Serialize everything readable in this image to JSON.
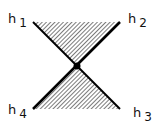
{
  "diagram": {
    "labels": [
      {
        "id": "h1",
        "base": "h",
        "sub": "1"
      },
      {
        "id": "h2",
        "base": "h",
        "sub": "2"
      },
      {
        "id": "h3",
        "base": "h",
        "sub": "3"
      },
      {
        "id": "h4",
        "base": "h",
        "sub": "4"
      }
    ],
    "colors": {
      "line": "#000000",
      "hatch": "#222222",
      "background": "#ffffff"
    }
  }
}
